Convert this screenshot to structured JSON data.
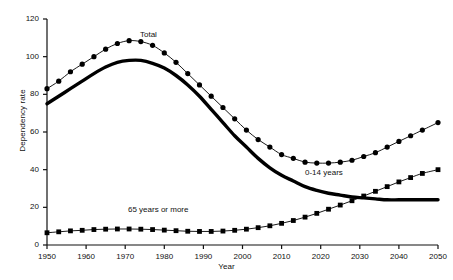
{
  "chart_data": {
    "type": "line",
    "title": "",
    "xlabel": "Year",
    "ylabel": "Dependency rate",
    "xlim": [
      1950,
      2050
    ],
    "ylim": [
      0,
      120
    ],
    "xticks": [
      1950,
      1960,
      1970,
      1980,
      1990,
      2000,
      2010,
      2020,
      2030,
      2040,
      2050
    ],
    "yticks": [
      0,
      20,
      40,
      60,
      80,
      100,
      120
    ],
    "grid": false,
    "legend_position": "inline-annotations",
    "x": [
      1950,
      1953,
      1956,
      1959,
      1962,
      1965,
      1968,
      1971,
      1974,
      1977,
      1980,
      1983,
      1986,
      1989,
      1992,
      1995,
      1998,
      2001,
      2004,
      2007,
      2010,
      2013,
      2016,
      2019,
      2022,
      2025,
      2028,
      2031,
      2034,
      2037,
      2040,
      2043,
      2046,
      2050
    ],
    "series": [
      {
        "name": "Total",
        "marker": "circle",
        "values": [
          83,
          87,
          92,
          96,
          100,
          104,
          107,
          108.5,
          108,
          106,
          102,
          97,
          91,
          85,
          79,
          73,
          67,
          61,
          56,
          52,
          48,
          46,
          44,
          43.5,
          43.5,
          44,
          45,
          47,
          49,
          52,
          55,
          58,
          61,
          65
        ]
      },
      {
        "name": "0-14 years",
        "marker": "line",
        "values": [
          75,
          79,
          83,
          87,
          91,
          94.5,
          97,
          98,
          98,
          96.5,
          94,
          90,
          85,
          79,
          72,
          65,
          58,
          52,
          46,
          41,
          37,
          34,
          31,
          29,
          27.5,
          26.5,
          25.5,
          25,
          24.5,
          24,
          24,
          24,
          24,
          24
        ]
      },
      {
        "name": "65 years or more",
        "marker": "square",
        "values": [
          6.5,
          7,
          7.5,
          7.8,
          8.2,
          8.4,
          8.5,
          8.5,
          8.4,
          8.2,
          7.9,
          7.6,
          7.3,
          7.2,
          7.2,
          7.4,
          7.8,
          8.4,
          9.2,
          10.2,
          11.5,
          13,
          14.8,
          16.8,
          19,
          21.2,
          23.5,
          26,
          28.5,
          31,
          33.5,
          35.8,
          38,
          40
        ]
      }
    ],
    "annotations": [
      {
        "text": "Total",
        "x": 1973,
        "y": 112
      },
      {
        "text": "0-14 years",
        "x": 2020,
        "y": 35
      },
      {
        "text": "65 years or more",
        "x": 1978,
        "y": 16
      }
    ]
  },
  "axes": {
    "ylabel": "Dependency rate",
    "xlabel": "Year",
    "yticks": [
      "0",
      "20",
      "40",
      "60",
      "80",
      "100",
      "120"
    ],
    "xticks": [
      "1950",
      "1960",
      "1970",
      "1980",
      "1990",
      "2000",
      "2010",
      "2020",
      "2030",
      "2040",
      "2050"
    ]
  },
  "labels": {
    "total": "Total",
    "young": "0-14 years",
    "old": "65 years or more"
  },
  "colors": {
    "ink": "#000000",
    "background": "#ffffff"
  }
}
